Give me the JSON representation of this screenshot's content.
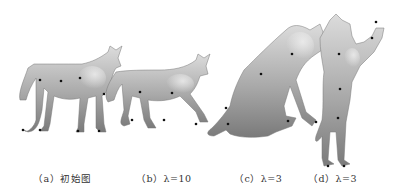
{
  "figure": {
    "panels": [
      {
        "id": "a",
        "caption": "（a）初始图",
        "subject": "wolf-standing"
      },
      {
        "id": "b",
        "caption": "（b）λ=10",
        "subject": "wolf-running"
      },
      {
        "id": "c",
        "caption": "（c）λ=3",
        "subject": "wolf-sitting"
      },
      {
        "id": "d",
        "caption": "（d）λ=3",
        "subject": "wolf-rearing"
      }
    ],
    "colors": {
      "model_light": "#d8d8d8",
      "model_mid": "#a8a8a8",
      "model_dark": "#6a6a6a",
      "constraint_point": "#111111",
      "caption_text": "#333333"
    }
  }
}
